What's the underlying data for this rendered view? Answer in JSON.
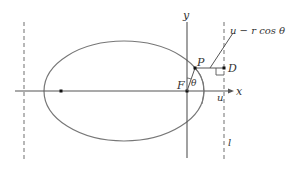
{
  "diagram": {
    "labels": {
      "x_axis": "x",
      "y_axis": "y",
      "focus": "F",
      "point": "P",
      "directrix_point": "D",
      "angle": "θ",
      "u_mark": "u",
      "directrix": "l",
      "distance_expr": "u − r cos θ"
    },
    "colors": {
      "axis": "#555555",
      "ellipse": "#777777",
      "dashed": "#888888",
      "text": "#333333",
      "points": "#111111"
    }
  }
}
